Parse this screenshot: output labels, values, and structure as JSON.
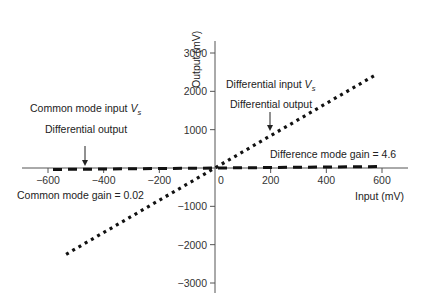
{
  "chart_data": {
    "type": "line",
    "title": "",
    "xlabel": "Input (mV)",
    "ylabel": "Output (mV)",
    "xlim": [
      -690,
      690
    ],
    "ylim": [
      -3300,
      3300
    ],
    "x_ticks": [
      -600,
      -400,
      -200,
      0,
      200,
      400,
      600
    ],
    "x_tick_labels": [
      "−600",
      "−400",
      "−200",
      "0",
      "200",
      "400",
      "600"
    ],
    "y_ticks": [
      3000,
      2000,
      1000,
      -1000,
      -2000,
      -3000
    ],
    "y_tick_labels": [
      "3000",
      "2000",
      "1000",
      "−1000",
      "−2000",
      "−3000"
    ],
    "grid": false,
    "legend": null,
    "series": [
      {
        "name": "Differential input Vs",
        "style": "dotted",
        "gain": 4.6,
        "x": [
          -535,
          571
        ],
        "y": [
          -2250,
          2405
        ]
      },
      {
        "name": "Common mode input Vs",
        "style": "dashed",
        "gain": 0.02,
        "x": [
          -582,
          600
        ],
        "y": [
          -40,
          40
        ]
      }
    ],
    "annotations": [
      {
        "text": "Common mode input",
        "subscript_var": "V",
        "subscript": "s",
        "x": -550,
        "y": 700
      },
      {
        "text": "Differential output",
        "x": -480,
        "y": 450,
        "arrow_to": [
          -470,
          0
        ]
      },
      {
        "text": "Common mode gain = 0.02",
        "x": -640,
        "y": -470
      },
      {
        "text": "Differential input",
        "subscript_var": "V",
        "subscript": "s",
        "x": 30,
        "y": 1670
      },
      {
        "text": "Differential output",
        "x": 40,
        "y": 1240,
        "arrow_to": [
          200,
          800
        ]
      },
      {
        "text": "Difference mode gain = 4.6",
        "x": 110,
        "y": 260
      }
    ]
  },
  "labels": {
    "x_axis_title": "Input (mV)",
    "y_axis_title": "Output (mV)",
    "cm_input": "Common mode input ",
    "cm_input_var": "V",
    "cm_input_sub": "s",
    "cm_output": "Differential output",
    "cm_gain": "Common mode gain = 0.02",
    "dm_input": "Differential input ",
    "dm_input_var": "V",
    "dm_input_sub": "s",
    "dm_output": "Differential output",
    "dm_gain": "Difference mode gain = 4.6"
  },
  "colors": {
    "axis": "#555555",
    "line": "#111111",
    "text": "#222222"
  }
}
